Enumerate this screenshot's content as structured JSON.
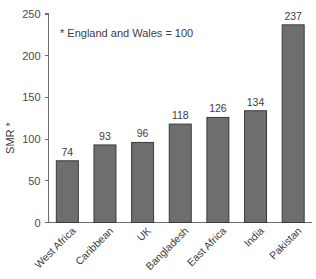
{
  "chart_data": {
    "type": "bar",
    "title": "",
    "subtitle": "",
    "xlabel": "",
    "ylabel": "SMR *",
    "annotation": "* England and Wales = 100",
    "categories": [
      "West Africa",
      "Caribbean",
      "UK",
      "Bangladesh",
      "East Africa",
      "India",
      "Pakistan"
    ],
    "values": [
      74,
      93,
      96,
      118,
      126,
      134,
      237
    ],
    "value_labels": [
      "74",
      "93",
      "96",
      "118",
      "126",
      "134",
      "237"
    ],
    "ylim": [
      0,
      250
    ],
    "yticks": [
      0,
      50,
      100,
      150,
      200,
      250
    ],
    "ytick_labels": [
      "0",
      "50",
      "100",
      "150",
      "200",
      "250"
    ],
    "grid": false,
    "legend": false,
    "legend_position": "none",
    "bar_color": "#6e6e6e",
    "bar_edge_color": "#3a3a3a",
    "axis_color": "#6b6b6b",
    "text_color": "#3d3d3d",
    "background": "#ffffff"
  }
}
